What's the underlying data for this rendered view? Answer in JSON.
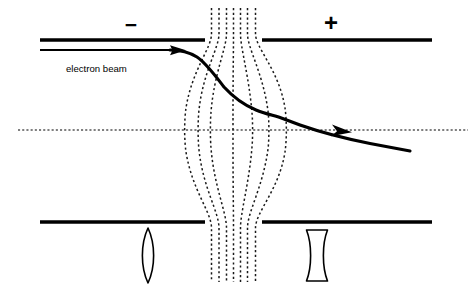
{
  "figure": {
    "background_color": "#ffffff",
    "line_color": "#000000",
    "field_line_color": "#1a1a1a",
    "width": 473,
    "height": 288
  },
  "labels": {
    "beam_label": "electron beam",
    "negative_sign": "−",
    "positive_sign": "+"
  },
  "electrodes": [
    {
      "name": "top-left-electrode",
      "polarity": "negative",
      "sign": "−",
      "x1": 40,
      "y1": 40,
      "x2": 205,
      "y2": 40
    },
    {
      "name": "top-right-electrode",
      "polarity": "positive",
      "sign": "+",
      "x1": 262,
      "y1": 40,
      "x2": 432,
      "y2": 40
    },
    {
      "name": "bottom-left-electrode",
      "polarity": "negative",
      "sign": "−",
      "x1": 40,
      "y1": 222,
      "x2": 205,
      "y2": 222
    },
    {
      "name": "bottom-right-electrode",
      "polarity": "positive",
      "sign": "+",
      "x1": 262,
      "y1": 222,
      "x2": 432,
      "y2": 222
    }
  ],
  "optical_axis": {
    "name": "optical-axis",
    "y": 130,
    "x_start": 18,
    "x_end": 468,
    "style": "dotted"
  },
  "sign_markers": [
    {
      "name": "minus-sign",
      "text": "−",
      "x": 131,
      "y": 26,
      "font_size": 21
    },
    {
      "name": "plus-sign",
      "text": "+",
      "x": 331,
      "y": 25,
      "font_size": 24
    }
  ],
  "field_lines": {
    "count": 7,
    "description": "Equipotential / field lines bulging outward between the electrode gap",
    "top_y": 8,
    "bottom_y": 282,
    "mid_y": 130,
    "top_x": [
      211.5,
      219.0,
      226.5,
      233.5,
      240.5,
      247.5,
      255.5
    ],
    "bottom_x": [
      211.5,
      219.0,
      226.5,
      233.5,
      240.5,
      247.5,
      255.5
    ],
    "mid_x": [
      186.0,
      199.0,
      211.0,
      233.0,
      252.0,
      268.0,
      285.0
    ],
    "gap_top_y": 40,
    "gap_bottom_y": 222
  },
  "beam": {
    "name": "electron-beam-trajectory",
    "incoming": {
      "x1": 40,
      "y1": 50,
      "x2": 170,
      "y2": 50
    },
    "incoming_arrow": {
      "x": 183,
      "y": 50,
      "size": 9
    },
    "trajectory_points": [
      [
        170,
        50
      ],
      [
        183,
        50.5
      ],
      [
        192,
        53
      ],
      [
        200,
        59
      ],
      [
        208,
        68
      ],
      [
        218,
        80
      ],
      [
        228,
        91
      ],
      [
        240,
        101
      ],
      [
        252,
        108
      ],
      [
        262,
        112
      ],
      [
        272,
        115
      ],
      [
        282,
        118
      ],
      [
        300,
        125
      ],
      [
        320,
        132
      ],
      [
        345,
        138
      ],
      [
        370,
        143
      ],
      [
        395,
        148
      ],
      [
        410,
        151
      ]
    ],
    "axis_crossing": {
      "x": 345,
      "y": 130
    },
    "exit_arrow": {
      "x": 352,
      "y": 132,
      "angle_deg": 13
    },
    "end_point": {
      "x": 410,
      "y": 151
    },
    "label": {
      "text": "electron beam",
      "x": 66,
      "y": 72
    }
  },
  "lens_symbols": [
    {
      "name": "converging-lens-symbol",
      "type": "biconvex",
      "meaning": "converging",
      "center_x": 148,
      "top_y": 228,
      "bottom_y": 283,
      "half_width": 7.5
    },
    {
      "name": "diverging-lens-symbol",
      "type": "biconcave",
      "meaning": "diverging",
      "center_x": 317,
      "top_y": 228,
      "bottom_y": 283,
      "half_width": 10.5,
      "waist_half_width": 4.5
    }
  ]
}
